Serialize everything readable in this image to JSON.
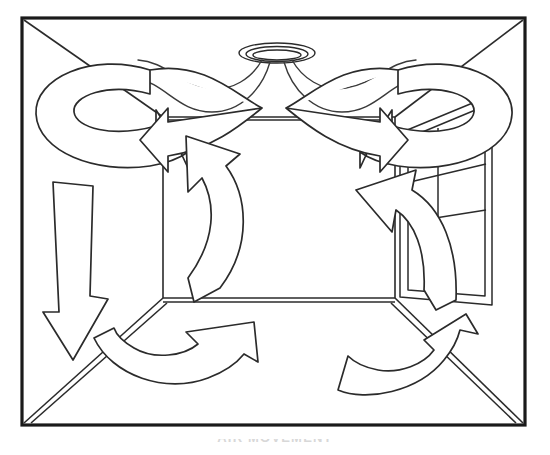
{
  "figure": {
    "caption": "AIR MOVEMENT",
    "palette": {
      "background": "#ffffff",
      "frame_stroke": "#1a1a1a",
      "line_stroke": "#2b2b2b",
      "arrow_fill": "#ffffff",
      "airflow_stroke": "#3a3a3a",
      "caption_text": "#d8d8d8"
    }
  },
  "frame": {
    "label": "picture-frame-border",
    "x": 22,
    "y": 18,
    "width": 503,
    "height": 407
  },
  "room": {
    "label": "room-interior-perspective",
    "back_wall": {
      "label": "back-wall",
      "left": 163,
      "top": 117,
      "right": 395,
      "bottom": 298
    },
    "surfaces": [
      {
        "name": "ceiling",
        "label": "ceiling-plane"
      },
      {
        "name": "left-wall",
        "label": "left-wall-plane"
      },
      {
        "name": "right-wall",
        "label": "right-wall-plane"
      },
      {
        "name": "floor",
        "label": "floor-plane"
      },
      {
        "name": "back-wall",
        "label": "back-wall-plane"
      }
    ]
  },
  "fixtures": {
    "ceiling_diffuser": {
      "label": "ceiling-air-diffuser",
      "shape": "elliptical-round-diffuser",
      "center_x": 277,
      "center_y": 53,
      "rings": 3
    },
    "window": {
      "label": "right-wall-window",
      "panes": 3,
      "position": "right wall"
    }
  },
  "airflow": {
    "supply_streams": {
      "label": "supply-air-streams",
      "count": 4,
      "origin": "ceiling diffuser",
      "pattern": "radial ceiling jet spreading to side walls"
    },
    "arrows": [
      {
        "id": "ceiling-left-swirl",
        "label": "ceiling-left-swirl-arrow",
        "type": "looping",
        "direction": "clockwise loop ending pointing right-down into room",
        "location": "ceiling, left half"
      },
      {
        "id": "ceiling-right-swirl",
        "label": "ceiling-right-swirl-arrow",
        "type": "looping",
        "direction": "counter-clockwise loop ending pointing left-down into room",
        "location": "ceiling, right half"
      },
      {
        "id": "left-wall-down",
        "label": "left-wall-downward-arrow",
        "type": "straight",
        "direction": "down",
        "location": "left wall"
      },
      {
        "id": "back-wall-center-up",
        "label": "back-wall-upward-curved-arrow",
        "type": "curved",
        "direction": "up and to the left",
        "location": "back wall, center-left"
      },
      {
        "id": "right-wall-up",
        "label": "right-wall-upward-curved-arrow",
        "type": "curved",
        "direction": "up and to the left",
        "location": "right wall"
      },
      {
        "id": "floor-left-up",
        "label": "floor-left-curved-arrow",
        "type": "curved",
        "direction": "up and to the right",
        "location": "floor, left-center"
      },
      {
        "id": "floor-right-up",
        "label": "floor-right-curved-arrow",
        "type": "curved",
        "direction": "up and to the right",
        "location": "floor, right"
      }
    ]
  }
}
